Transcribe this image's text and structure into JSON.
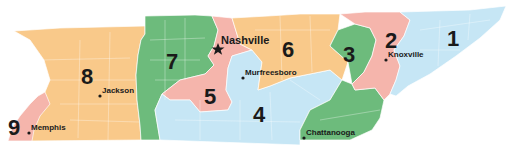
{
  "map": {
    "subject": "Tennessee congressional districts",
    "colors": {
      "orange": "#f9c98a",
      "green": "#6dbb7c",
      "pink": "#f5b5ac",
      "blue": "#c6e6f5"
    },
    "districts": [
      {
        "number": "1",
        "color": "blue"
      },
      {
        "number": "2",
        "color": "pink"
      },
      {
        "number": "3",
        "color": "green"
      },
      {
        "number": "4",
        "color": "blue"
      },
      {
        "number": "5",
        "color": "pink"
      },
      {
        "number": "6",
        "color": "orange"
      },
      {
        "number": "7",
        "color": "green"
      },
      {
        "number": "8",
        "color": "orange"
      },
      {
        "number": "9",
        "color": "pink"
      }
    ],
    "cities": [
      {
        "name": "Nashville",
        "marker": "star",
        "capital": true
      },
      {
        "name": "Murfreesboro",
        "marker": "dot"
      },
      {
        "name": "Knoxville",
        "marker": "dot"
      },
      {
        "name": "Jackson",
        "marker": "dot"
      },
      {
        "name": "Memphis",
        "marker": "dot"
      },
      {
        "name": "Chattanooga",
        "marker": "dot"
      }
    ]
  }
}
